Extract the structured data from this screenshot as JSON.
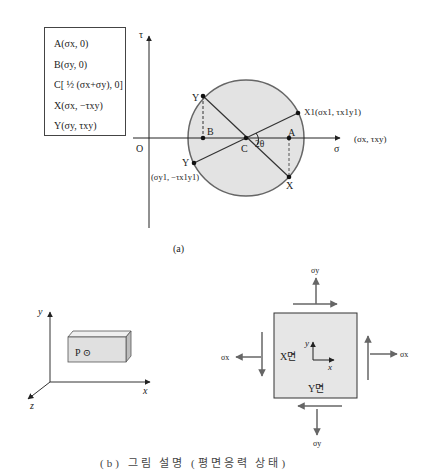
{
  "mohr_circle": {
    "panel_label": "(a)",
    "legend": [
      "A(σx, 0)",
      "B(σy, 0)",
      "C[ ½ (σx+σy), 0]",
      "X(σx, −τxy)",
      "Y(σy, τxy)"
    ],
    "axes": {
      "vertical": "τ",
      "horizontal": "σ",
      "origin": "O",
      "right_note": "(σx, τxy)"
    },
    "points": {
      "A": "A",
      "B": "B",
      "C": "C",
      "X": "X",
      "Y_top": "Y",
      "Y_bottom": "Y",
      "X1": "X1(σx1, τx1y1)",
      "Y1_coords": "(σy1, −τx1y1)"
    },
    "angle": "2θ",
    "colors": {
      "circle_fill": "#e3e3e3",
      "circle_stroke": "#666666",
      "line": "#333333"
    }
  },
  "body_sketch": {
    "axes": {
      "x": "x",
      "y": "y",
      "z": "z"
    },
    "point_label": "P ⊙",
    "colors": {
      "block_front": "#e0e0e0",
      "block_side": "#bdbdbd",
      "block_top": "#efefef"
    }
  },
  "stress_element": {
    "labels": {
      "sigma_y_top": "σy",
      "sigma_y_bottom": "σy",
      "sigma_x_left": "σx",
      "sigma_x_right": "σx"
    },
    "inner_axes": {
      "x": "x",
      "y": "y"
    },
    "face_labels": {
      "x_face": "X면",
      "y_face": "Y면"
    },
    "colors": {
      "fill": "#e6e6e6",
      "arrow": "#666666"
    }
  },
  "caption": {
    "text": "(b) 그림 설명 (평면응력 상태)"
  }
}
